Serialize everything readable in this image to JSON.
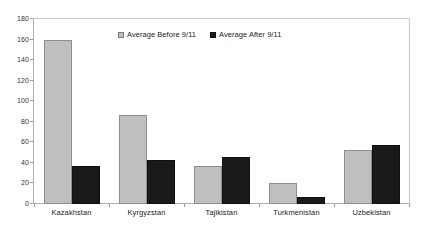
{
  "chart_data": {
    "type": "bar",
    "title": "",
    "subtitle": "",
    "xlabel": "",
    "ylabel": "",
    "ylim": [
      0,
      180
    ],
    "ytick_step": 20,
    "yticks": [
      180,
      160,
      140,
      120,
      100,
      80,
      60,
      40,
      20,
      0
    ],
    "grid": false,
    "legend_position": "top-center-inside",
    "categories": [
      "Kazakhstan",
      "Kyrgyzstan",
      "Tajikistan",
      "Turkmenistan",
      "Uzbekistan"
    ],
    "series": [
      {
        "name": "Average Before 9/11",
        "color": "#BFBFBF",
        "values": [
          160,
          87,
          37,
          20,
          53
        ]
      },
      {
        "name": "Average After 9/11",
        "color": "#1A1A1A",
        "values": [
          37,
          43,
          46,
          7,
          57
        ]
      }
    ]
  },
  "legend": {
    "entries": [
      {
        "label": "Average Before 9/11",
        "swatch": "legend-swatch-before"
      },
      {
        "label": "Average After 9/11",
        "swatch": "legend-swatch-after"
      }
    ]
  },
  "colors": {
    "series_before": "#BFBFBF",
    "series_after": "#1A1A1A",
    "axis_line": "#B0B0B0",
    "plot_background": "#FFFFFF",
    "text": "#1A1A1A"
  }
}
